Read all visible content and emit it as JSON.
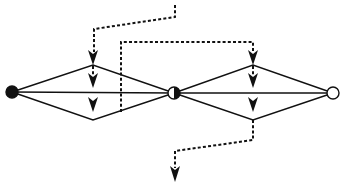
{
  "diagram": {
    "type": "signal-flow-network",
    "background": "#ffffff",
    "stroke_color": "#111111",
    "nodes": [
      {
        "id": "left",
        "x": 12,
        "y": 92,
        "r": 6,
        "fill": "solid",
        "label": ""
      },
      {
        "id": "middle",
        "x": 174,
        "y": 93,
        "r": 6,
        "fill": "half",
        "label": ""
      },
      {
        "id": "right",
        "x": 333,
        "y": 93,
        "r": 6,
        "fill": "hollow",
        "label": ""
      }
    ],
    "diamonds": [
      {
        "id": "left-diamond",
        "from": "left",
        "to": "middle",
        "top": [
          93,
          65
        ],
        "bottom": [
          93,
          120
        ]
      },
      {
        "id": "right-diamond",
        "from": "middle",
        "to": "right",
        "top": [
          253,
          65
        ],
        "bottom": [
          253,
          120
        ]
      }
    ],
    "arrows": [
      {
        "id": "left-upper-arrow",
        "x": 93,
        "y_tip": 65
      },
      {
        "id": "left-inner-upper-arrow",
        "x": 93,
        "y_tip": 88
      },
      {
        "id": "left-inner-lower-arrow",
        "x": 93,
        "y_tip": 112
      },
      {
        "id": "right-upper-arrow",
        "x": 253,
        "y_tip": 65
      },
      {
        "id": "right-inner-upper-arrow",
        "x": 253,
        "y_tip": 88
      },
      {
        "id": "right-inner-lower-arrow",
        "x": 253,
        "y_tip": 112
      },
      {
        "id": "output-arrow",
        "x": 175,
        "y_tip": 182
      }
    ],
    "dashed_paths": [
      {
        "id": "input-path-1",
        "points": [
          [
            175,
            5
          ],
          [
            175,
            17
          ],
          [
            94,
            29
          ],
          [
            94,
            52
          ]
        ]
      },
      {
        "id": "input-path-2",
        "points": [
          [
            121,
            112
          ],
          [
            121,
            42
          ],
          [
            253,
            42
          ],
          [
            253,
            52
          ]
        ]
      },
      {
        "id": "output-path",
        "points": [
          [
            253,
            120
          ],
          [
            253,
            140
          ],
          [
            175,
            151
          ],
          [
            175,
            168
          ]
        ]
      }
    ]
  }
}
